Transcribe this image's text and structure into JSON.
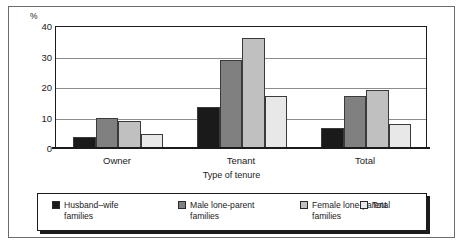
{
  "chart_data": {
    "type": "bar",
    "title": "",
    "subtitle": "",
    "xlabel": "Type of tenure",
    "ylabel": "%",
    "categories": [
      "Owner",
      "Tenant",
      "Total"
    ],
    "series": [
      {
        "name": "Husband–wife families",
        "values": [
          3.5,
          13.5,
          6.5
        ],
        "color": "#1a1a1a"
      },
      {
        "name": "Male lone-parent families",
        "values": [
          10.0,
          29.0,
          17.0
        ],
        "color": "#808080"
      },
      {
        "name": "Female lone-parent families",
        "values": [
          9.0,
          36.0,
          19.0
        ],
        "color": "#c0c0c0"
      },
      {
        "name": "Total",
        "values": [
          4.5,
          17.0,
          8.0
        ],
        "color": "#e8e8e8"
      }
    ],
    "ylim": [
      0,
      40
    ],
    "yticks": [
      0,
      10,
      20,
      30,
      40
    ],
    "ytick_labels": [
      "0",
      "10",
      "20",
      "30",
      "40"
    ],
    "grid": true,
    "grid_axis": "y",
    "legend_position": "bottom"
  },
  "axis": {
    "unit_label": "%",
    "x_title": "Type of tenure",
    "ticks_y": [
      "40",
      "30",
      "20",
      "10",
      "0"
    ],
    "ticks_x": [
      "Owner",
      "Tenant",
      "Total"
    ]
  },
  "legend": {
    "items": [
      {
        "label": "Husband–wife\nfamilies",
        "color": "#1a1a1a"
      },
      {
        "label": "Male lone-parent\nfamilies",
        "color": "#808080"
      },
      {
        "label": "Female lone-parent\nfamilies",
        "color": "#c0c0c0"
      },
      {
        "label": "Total",
        "color": "#e8e8e8"
      }
    ]
  }
}
